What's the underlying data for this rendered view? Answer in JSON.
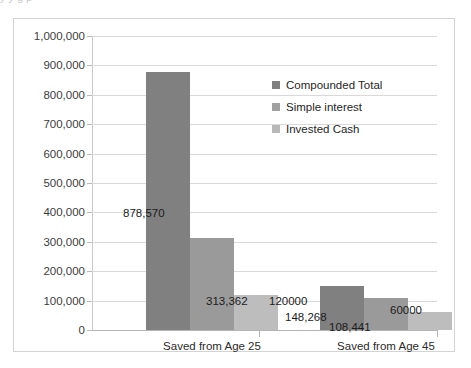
{
  "chart_data": {
    "type": "bar",
    "title": "",
    "subtitle": "",
    "xlabel": "",
    "ylabel": "",
    "categories": [
      "Saved from Age 25",
      "Saved from Age 45"
    ],
    "series": [
      {
        "name": "Compounded Total",
        "color": "#808080",
        "values": [
          878570,
          148268
        ],
        "labels": [
          "878,570",
          "148,268"
        ]
      },
      {
        "name": "Simple interest",
        "color": "#9a9a9a",
        "values": [
          313362,
          108441
        ],
        "labels": [
          "313,362",
          "108,441"
        ]
      },
      {
        "name": "Invested Cash",
        "color": "#bdbdbd",
        "values": [
          120000,
          60000
        ],
        "labels": [
          "120000",
          "60000"
        ]
      }
    ],
    "ylim": [
      0,
      1000000
    ],
    "ytick_step": 100000,
    "ytick_labels": [
      "1,000,000",
      "900,000",
      "800,000",
      "700,000",
      "600,000",
      "500,000",
      "400,000",
      "300,000",
      "200,000",
      "100,000",
      "0"
    ],
    "grid": true,
    "grid_axis": "y",
    "legend_position": "upper right inside plot",
    "legend_entries": [
      "Compounded Total",
      "Simple interest",
      "Invested Cash"
    ]
  },
  "artifacts": {
    "top_cut_text": "y         y            g     p"
  }
}
